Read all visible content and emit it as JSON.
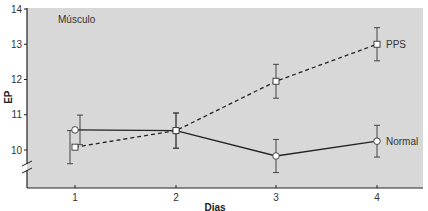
{
  "chart_data": {
    "type": "line",
    "title": "",
    "panel_label": "Músculo",
    "xlabel": "Dias",
    "ylabel": "EP",
    "x": [
      1,
      2,
      3,
      4
    ],
    "x_tick_labels": [
      "1",
      "2",
      "3",
      "4"
    ],
    "y_tick_labels": [
      "10",
      "11",
      "12",
      "13",
      "14"
    ],
    "ylim": [
      9.0,
      14.0
    ],
    "y_axis_break": true,
    "grid": false,
    "legend_position": "inline-right",
    "series": [
      {
        "name": "Normal",
        "line_style": "solid",
        "marker": "circle",
        "values": [
          10.57,
          10.55,
          9.83,
          10.25
        ],
        "errors": [
          0.42,
          0.5,
          0.47,
          0.45
        ]
      },
      {
        "name": "PPS",
        "line_style": "dashed",
        "marker": "square",
        "values": [
          10.08,
          10.55,
          11.95,
          13.0
        ],
        "errors": [
          0.47,
          0.5,
          0.48,
          0.47
        ]
      }
    ]
  },
  "colors": {
    "plot_background": "#d8d8d8",
    "line": "#222222",
    "marker_fill": "#ffffff"
  }
}
